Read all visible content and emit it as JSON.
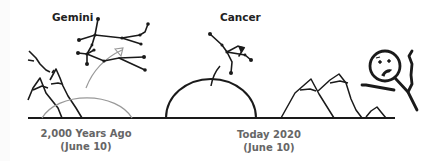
{
  "diagram": {
    "constellations": {
      "left": {
        "label": "Gemini"
      },
      "right": {
        "label": "Cancer"
      }
    },
    "captions": {
      "past": {
        "line1": "2,000 Years Ago",
        "line2": "(June 10)"
      },
      "present": {
        "line1": "Today 2020",
        "line2": "(June 10)"
      }
    },
    "colors": {
      "ink": "#1a1a1a",
      "past_arc": "#999999",
      "caption_text": "#666666"
    },
    "icons": [
      "mountain-icon",
      "sun-arc-icon",
      "constellation-icon",
      "stick-figure-icon",
      "arrow-icon"
    ]
  }
}
